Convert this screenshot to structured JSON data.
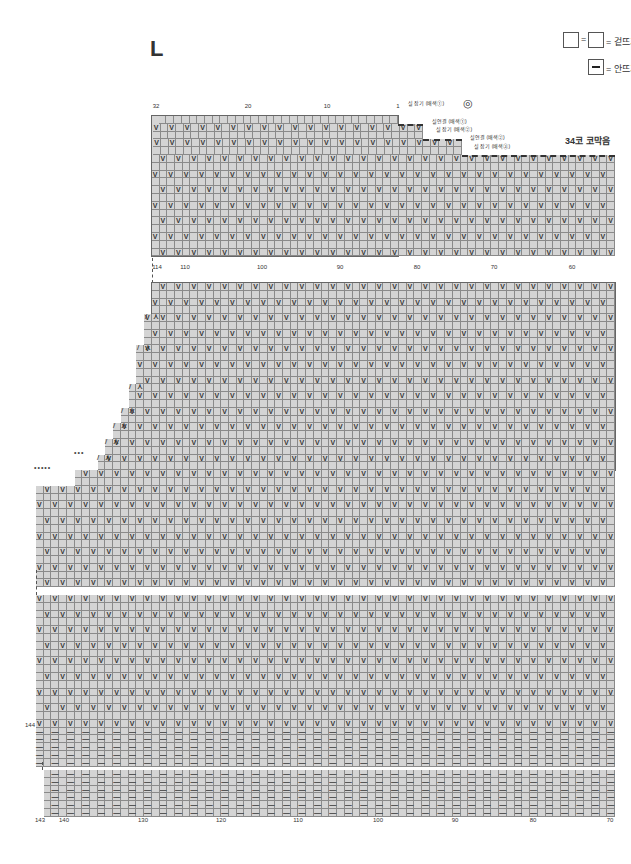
{
  "size_label": "L",
  "legend": {
    "knit": {
      "label": "= 겉뜨기",
      "symbol": "blank-square"
    },
    "purl": {
      "label": "= 안뜨기",
      "symbol": "dash-square"
    }
  },
  "symbols": {
    "slip": "V",
    "purl": "—",
    "dec_left": "/",
    "dec_right": "⋏"
  },
  "top_chart": {
    "top_ticks": [
      {
        "label": "32",
        "x": 156
      },
      {
        "label": "20",
        "x": 248
      },
      {
        "label": "10",
        "x": 327
      },
      {
        "label": "1",
        "x": 398
      }
    ],
    "bottom_ticks": [
      {
        "label": "114",
        "x": 157
      },
      {
        "label": "110",
        "x": 185
      },
      {
        "label": "100",
        "x": 262
      },
      {
        "label": "90",
        "x": 340
      },
      {
        "label": "80",
        "x": 417
      },
      {
        "label": "70",
        "x": 494
      },
      {
        "label": "60",
        "x": 572
      }
    ],
    "notes": [
      {
        "text": "실 잡기 (배색①)",
        "x": 408,
        "y": 99
      },
      {
        "text": "실연결 (배색①)",
        "x": 432,
        "y": 117
      },
      {
        "text": "실 잡기 (배색②)",
        "x": 436,
        "y": 125
      },
      {
        "text": "실연결 (배색②)",
        "x": 470,
        "y": 133
      },
      {
        "text": "실 잡기 (배색③)",
        "x": 474,
        "y": 142
      }
    ],
    "marker": "◎",
    "bind_off": "34코 코막음"
  },
  "bottom_chart": {
    "ticks": [
      {
        "label": "143",
        "x": 40
      },
      {
        "label": "140",
        "x": 64
      },
      {
        "label": "130",
        "x": 143
      },
      {
        "label": "120",
        "x": 221
      },
      {
        "label": "110",
        "x": 298
      },
      {
        "label": "100",
        "x": 378
      },
      {
        "label": "90",
        "x": 455
      },
      {
        "label": "80",
        "x": 533
      },
      {
        "label": "70",
        "x": 610
      }
    ],
    "row_label": {
      "text": "144",
      "x": 30,
      "y": 722
    }
  },
  "chart_data": {
    "type": "table",
    "title": "L",
    "stitch_range": [
      1,
      144
    ],
    "legend": [
      "□ = 겉뜨기 (knit)",
      "— = 안뜨기 (purl)"
    ],
    "annotations": [
      "실 잡기 (배색①)",
      "실연결 (배색①)",
      "실 잡기 (배색②)",
      "실연결 (배색②)",
      "실 잡기 (배색③)",
      "34코 코막음"
    ]
  }
}
